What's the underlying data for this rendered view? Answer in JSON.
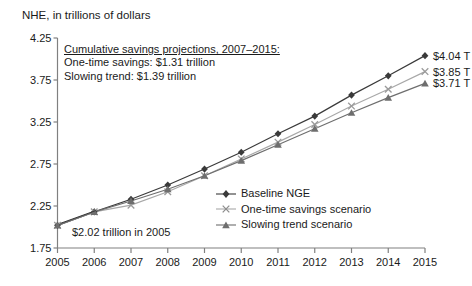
{
  "axis_title": "NHE, in trillions of dollars",
  "annotation": {
    "heading": "Cumulative savings projections, 2007–2015:",
    "line2": "One-time savings: $1.31 trillion",
    "line3": "Slowing trend: $1.39 trillion"
  },
  "start_label": "$2.02 trillion in 2005",
  "end_labels": [
    "$4.04 T",
    "$3.85 T",
    "$3.71 T"
  ],
  "legend": [
    {
      "label": "Baseline NGE",
      "marker": "diamond-marker",
      "color": "#3a3a3a"
    },
    {
      "label": "One-time savings scenario",
      "marker": "x-marker",
      "color": "#9a9a9a"
    },
    {
      "label": "Slowing trend scenario",
      "marker": "triangle-marker",
      "color": "#6e6e6e"
    }
  ],
  "chart_data": {
    "type": "line",
    "title": "NHE, in trillions of dollars",
    "xlabel": "",
    "ylabel": "NHE, in trillions of dollars",
    "x": [
      2005,
      2006,
      2007,
      2008,
      2009,
      2010,
      2011,
      2012,
      2013,
      2014,
      2015
    ],
    "categories": [
      "2005",
      "2006",
      "2007",
      "2008",
      "2009",
      "2010",
      "2011",
      "2012",
      "2013",
      "2014",
      "2015"
    ],
    "xlim": [
      2005,
      2015
    ],
    "ylim": [
      1.75,
      4.25
    ],
    "yticks": [
      1.75,
      2.25,
      2.75,
      3.25,
      3.75,
      4.25
    ],
    "ytick_labels": [
      "1.75",
      "2.25",
      "2.75",
      "3.25",
      "3.75",
      "4.25"
    ],
    "grid": false,
    "legend_position": "inside-center-right",
    "series": [
      {
        "name": "Baseline NGE",
        "marker": "diamond",
        "color": "#3a3a3a",
        "values": [
          2.02,
          2.18,
          2.33,
          2.5,
          2.69,
          2.89,
          3.11,
          3.32,
          3.57,
          3.8,
          4.04
        ],
        "end_label": "$4.04 T"
      },
      {
        "name": "One-time savings scenario",
        "marker": "x",
        "color": "#9a9a9a",
        "values": [
          2.02,
          2.18,
          2.26,
          2.42,
          2.61,
          2.81,
          3.01,
          3.22,
          3.44,
          3.64,
          3.85
        ],
        "end_label": "$3.85 T"
      },
      {
        "name": "Slowing trend scenario",
        "marker": "triangle",
        "color": "#6e6e6e",
        "values": [
          2.02,
          2.18,
          2.31,
          2.45,
          2.61,
          2.79,
          2.98,
          3.17,
          3.36,
          3.54,
          3.71
        ],
        "end_label": "$3.71 T"
      }
    ],
    "annotations": [
      {
        "text": "$2.02 trillion in 2005",
        "target_x": 2005,
        "target_y": 2.02
      },
      {
        "text": "Cumulative savings projections, 2007–2015:"
      },
      {
        "text": "One-time savings: $1.31 trillion"
      },
      {
        "text": "Slowing trend: $1.39 trillion"
      }
    ]
  }
}
